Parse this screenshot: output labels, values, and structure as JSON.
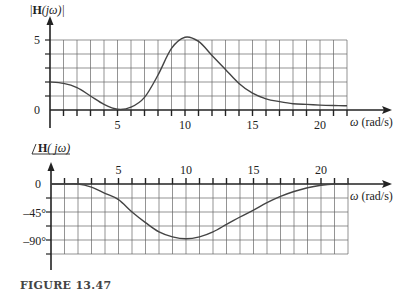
{
  "figure": {
    "caption": "FIGURE 13.47"
  },
  "chart_data": [
    {
      "type": "line",
      "title": "",
      "ylabel": "|H(jω)|",
      "xlabel": "ω (rad/s)",
      "xlim": [
        0,
        22
      ],
      "ylim": [
        0,
        5
      ],
      "grid": true,
      "x_ticks": [
        5,
        10,
        15,
        20
      ],
      "y_ticks": [
        "0",
        "5"
      ],
      "x": [
        0,
        1,
        2,
        3,
        4,
        5,
        6,
        7,
        8,
        9,
        10,
        11,
        12,
        13,
        14,
        15,
        16,
        17,
        18,
        19,
        20,
        21,
        22
      ],
      "values": [
        2.0,
        1.9,
        1.6,
        1.0,
        0.4,
        0.05,
        0.2,
        0.9,
        2.5,
        4.4,
        5.2,
        4.9,
        3.9,
        2.9,
        1.9,
        1.2,
        0.8,
        0.6,
        0.45,
        0.4,
        0.35,
        0.32,
        0.3
      ]
    },
    {
      "type": "line",
      "title": "",
      "ylabel": "∠H(jω)",
      "xlabel": "ω (rad/s)",
      "xlim": [
        0,
        22
      ],
      "ylim": [
        -112.5,
        0
      ],
      "grid": true,
      "x_ticks": [
        5,
        10,
        15,
        20
      ],
      "y_ticks": [
        "0",
        "–45°",
        "–90°"
      ],
      "x": [
        0,
        1,
        2,
        3,
        4,
        5,
        6,
        7,
        8,
        9,
        10,
        11,
        12,
        13,
        14,
        15,
        16,
        17,
        18,
        19,
        20,
        21,
        22
      ],
      "values": [
        0,
        0,
        0,
        -5,
        -15,
        -25,
        -45,
        -62,
        -77,
        -85,
        -88,
        -85,
        -77,
        -65,
        -53,
        -42,
        -30,
        -20,
        -12,
        -6,
        -2,
        0,
        0
      ]
    }
  ],
  "labels": {
    "mag_ylabel_prefix": "|",
    "mag_ylabel_H": "H",
    "mag_ylabel_rest": "(jω)|",
    "phase_ylabel_H": "H",
    "phase_ylabel_rest": "( jω)",
    "omega": "ω",
    "units": "(rad/s)"
  }
}
